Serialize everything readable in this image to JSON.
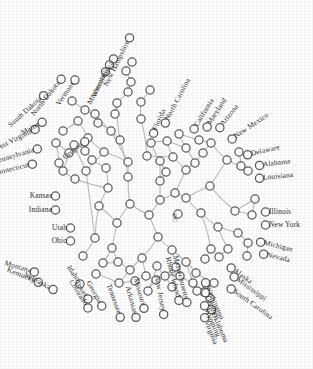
{
  "figure": {
    "type": "radial-dendrogram",
    "center_label": "DC",
    "node_count": 99,
    "leaf_count": 50,
    "colors": {
      "edge": "#b9b9b9",
      "node_stroke": "#5a5a5a",
      "node_fill": "#ffffff",
      "label": "#2b2b2b",
      "background": "#ffffff"
    }
  },
  "chart_data": {
    "type": "tree",
    "layout": "radial-unrooted",
    "center": {
      "x": 160,
      "y": 200
    },
    "grid": false,
    "legend": null,
    "center_node_label": "DC",
    "leaves": [
      {
        "label": "New Hampshire",
        "x": 128,
        "y": 41,
        "angle": -64,
        "anchor": "end"
      },
      {
        "label": "Iowa",
        "x": 112,
        "y": 62,
        "angle": -64,
        "anchor": "end"
      },
      {
        "label": "Wisconsin",
        "x": 108,
        "y": 68,
        "angle": -64,
        "anchor": "end"
      },
      {
        "label": "Minnesota",
        "x": 104,
        "y": 75,
        "angle": -64,
        "anchor": "end"
      },
      {
        "label": "Vermont",
        "x": 73,
        "y": 83,
        "angle": -56,
        "anchor": "end"
      },
      {
        "label": "North Dakota",
        "x": 59,
        "y": 82,
        "angle": -52,
        "anchor": "end"
      },
      {
        "label": "South Dakota",
        "x": 41,
        "y": 98,
        "angle": -42,
        "anchor": "end"
      },
      {
        "label": "Maine",
        "x": 39,
        "y": 124,
        "angle": -29,
        "anchor": "end"
      },
      {
        "label": "West Virginia",
        "x": 32,
        "y": 131,
        "angle": -27,
        "anchor": "end"
      },
      {
        "label": "Oregon",
        "x": 82,
        "y": 144,
        "angle": -38,
        "anchor": "end"
      },
      {
        "label": "Pennsylvania",
        "x": 34,
        "y": 150,
        "angle": -17,
        "anchor": "end"
      },
      {
        "label": "Connecticut",
        "x": 29,
        "y": 165,
        "angle": -14,
        "anchor": "end"
      },
      {
        "label": "Kansas",
        "x": 52,
        "y": 196,
        "angle": 0,
        "anchor": "end"
      },
      {
        "label": "Indiana",
        "x": 52,
        "y": 210,
        "angle": 0,
        "anchor": "end"
      },
      {
        "label": "Utah",
        "x": 67,
        "y": 228,
        "angle": 0,
        "anchor": "end"
      },
      {
        "label": "Ohio",
        "x": 67,
        "y": 241,
        "angle": 0,
        "anchor": "end"
      },
      {
        "label": "Montana",
        "x": 31,
        "y": 271,
        "angle": 16,
        "anchor": "end"
      },
      {
        "label": "Kentucky",
        "x": 35,
        "y": 281,
        "angle": 22,
        "anchor": "end"
      },
      {
        "label": "Nebraska",
        "x": 50,
        "y": 288,
        "angle": 27,
        "anchor": "end"
      },
      {
        "label": "Idaho",
        "x": 78,
        "y": 281,
        "angle": 56,
        "anchor": "end"
      },
      {
        "label": "Texas",
        "x": 86,
        "y": 296,
        "angle": 56,
        "anchor": "end"
      },
      {
        "label": "Colorado",
        "x": 86,
        "y": 305,
        "angle": 57,
        "anchor": "end"
      },
      {
        "label": "Georgia",
        "x": 100,
        "y": 303,
        "angle": 60,
        "anchor": "end"
      },
      {
        "label": "Tennessee",
        "x": 119,
        "y": 314,
        "angle": 70,
        "anchor": "end"
      },
      {
        "label": "Arkansas",
        "x": 135,
        "y": 314,
        "angle": 74,
        "anchor": "end"
      },
      {
        "label": "Missouri",
        "x": 143,
        "y": 305,
        "angle": 74,
        "anchor": "end"
      },
      {
        "label": "New Jersey",
        "x": 163,
        "y": 311,
        "angle": 79,
        "anchor": "end"
      },
      {
        "label": "Rhode Island",
        "x": 178,
        "y": 297,
        "angle": 75,
        "anchor": "end"
      },
      {
        "label": "Massachusetts",
        "x": 186,
        "y": 299,
        "angle": 76,
        "anchor": "end"
      },
      {
        "label": "Washington",
        "x": 207,
        "y": 286,
        "angle": 66,
        "anchor": "start"
      },
      {
        "label": "Oregon",
        "x": 207,
        "y": 296,
        "angle": 66,
        "anchor": "start"
      },
      {
        "label": "Wyoming",
        "x": 206,
        "y": 309,
        "angle": 66,
        "anchor": "start"
      },
      {
        "label": "Oklahoma",
        "x": 213,
        "y": 313,
        "angle": 66,
        "anchor": "start"
      },
      {
        "label": "Virginia",
        "x": 206,
        "y": 321,
        "angle": 68,
        "anchor": "start"
      },
      {
        "label": "Alaska",
        "x": 234,
        "y": 270,
        "angle": 36,
        "anchor": "start"
      },
      {
        "label": "Mississippi",
        "x": 237,
        "y": 279,
        "angle": 36,
        "anchor": "start"
      },
      {
        "label": "South Carolina",
        "x": 234,
        "y": 291,
        "angle": 36,
        "anchor": "start"
      },
      {
        "label": "Michigan",
        "x": 264,
        "y": 243,
        "angle": 14,
        "anchor": "start"
      },
      {
        "label": "Nevada",
        "x": 267,
        "y": 255,
        "angle": 14,
        "anchor": "start"
      },
      {
        "label": "Illinois",
        "x": 269,
        "y": 212,
        "angle": 0,
        "anchor": "start"
      },
      {
        "label": "New York",
        "x": 269,
        "y": 225,
        "angle": 0,
        "anchor": "start"
      },
      {
        "label": "Delaware",
        "x": 251,
        "y": 154,
        "angle": -13,
        "anchor": "start"
      },
      {
        "label": "Alabama",
        "x": 263,
        "y": 165,
        "angle": -7,
        "anchor": "start"
      },
      {
        "label": "Louisiana",
        "x": 263,
        "y": 178,
        "angle": -5,
        "anchor": "start"
      },
      {
        "label": "New Mexico",
        "x": 235,
        "y": 137,
        "angle": -34,
        "anchor": "start"
      },
      {
        "label": "Arizona",
        "x": 222,
        "y": 125,
        "angle": -52,
        "anchor": "start"
      },
      {
        "label": "Maryland",
        "x": 209,
        "y": 124,
        "angle": -57,
        "anchor": "start"
      },
      {
        "label": "California",
        "x": 196,
        "y": 126,
        "angle": -58,
        "anchor": "start"
      },
      {
        "label": "North Carolina",
        "x": 167,
        "y": 120,
        "angle": -62,
        "anchor": "start"
      },
      {
        "label": "Florida",
        "x": 155,
        "y": 130,
        "angle": -66,
        "anchor": "start"
      }
    ],
    "internal_nodes": [
      {
        "x": 160,
        "y": 200
      },
      {
        "x": 149,
        "y": 215
      },
      {
        "x": 160,
        "y": 181
      },
      {
        "x": 130,
        "y": 204
      },
      {
        "x": 175,
        "y": 193
      },
      {
        "x": 158,
        "y": 237
      },
      {
        "x": 117,
        "y": 223
      },
      {
        "x": 186,
        "y": 170
      },
      {
        "x": 142,
        "y": 258
      },
      {
        "x": 99,
        "y": 206
      },
      {
        "x": 178,
        "y": 214
      },
      {
        "x": 128,
        "y": 177
      },
      {
        "x": 186,
        "y": 198
      },
      {
        "x": 186,
        "y": 148
      },
      {
        "x": 172,
        "y": 250
      },
      {
        "x": 112,
        "y": 248
      },
      {
        "x": 201,
        "y": 213
      },
      {
        "x": 128,
        "y": 162
      },
      {
        "x": 210,
        "y": 186
      },
      {
        "x": 108,
        "y": 188
      },
      {
        "x": 195,
        "y": 163
      },
      {
        "x": 146,
        "y": 276
      },
      {
        "x": 103,
        "y": 263
      },
      {
        "x": 218,
        "y": 227
      },
      {
        "x": 186,
        "y": 262
      },
      {
        "x": 95,
        "y": 238
      },
      {
        "x": 235,
        "y": 211
      },
      {
        "x": 135,
        "y": 281
      },
      {
        "x": 83,
        "y": 256
      },
      {
        "x": 196,
        "y": 273
      },
      {
        "x": 203,
        "y": 153
      },
      {
        "x": 120,
        "y": 140
      },
      {
        "x": 211,
        "y": 143
      },
      {
        "x": 167,
        "y": 141
      },
      {
        "x": 151,
        "y": 143
      },
      {
        "x": 238,
        "y": 233
      },
      {
        "x": 227,
        "y": 160
      },
      {
        "x": 160,
        "y": 161
      },
      {
        "x": 141,
        "y": 119
      },
      {
        "x": 75,
        "y": 179
      },
      {
        "x": 86,
        "y": 171
      },
      {
        "x": 104,
        "y": 152
      },
      {
        "x": 88,
        "y": 138
      },
      {
        "x": 74,
        "y": 145
      },
      {
        "x": 63,
        "y": 171
      },
      {
        "x": 59,
        "y": 163
      },
      {
        "x": 111,
        "y": 131
      },
      {
        "x": 98,
        "y": 123
      },
      {
        "x": 95,
        "y": 114
      },
      {
        "x": 117,
        "y": 103
      },
      {
        "x": 128,
        "y": 92
      },
      {
        "x": 131,
        "y": 82
      },
      {
        "x": 126,
        "y": 71
      },
      {
        "x": 132,
        "y": 62
      },
      {
        "x": 85,
        "y": 110
      },
      {
        "x": 72,
        "y": 101
      },
      {
        "x": 78,
        "y": 121
      },
      {
        "x": 63,
        "y": 131
      },
      {
        "x": 56,
        "y": 143
      },
      {
        "x": 248,
        "y": 243
      },
      {
        "x": 247,
        "y": 256
      },
      {
        "x": 228,
        "y": 249
      },
      {
        "x": 219,
        "y": 257
      },
      {
        "x": 211,
        "y": 249
      },
      {
        "x": 205,
        "y": 259
      },
      {
        "x": 193,
        "y": 283
      },
      {
        "x": 180,
        "y": 276
      },
      {
        "x": 214,
        "y": 283
      },
      {
        "x": 204,
        "y": 292
      },
      {
        "x": 210,
        "y": 298
      },
      {
        "x": 197,
        "y": 291
      },
      {
        "x": 172,
        "y": 287
      },
      {
        "x": 165,
        "y": 276
      },
      {
        "x": 157,
        "y": 266
      },
      {
        "x": 130,
        "y": 270
      },
      {
        "x": 118,
        "y": 262
      },
      {
        "x": 96,
        "y": 274
      },
      {
        "x": 119,
        "y": 283
      },
      {
        "x": 156,
        "y": 280
      },
      {
        "x": 148,
        "y": 291
      },
      {
        "x": 176,
        "y": 267
      },
      {
        "x": 255,
        "y": 199
      },
      {
        "x": 252,
        "y": 215
      },
      {
        "x": 241,
        "y": 166
      },
      {
        "x": 239,
        "y": 152
      },
      {
        "x": 248,
        "y": 171
      },
      {
        "x": 199,
        "y": 140
      },
      {
        "x": 179,
        "y": 134
      },
      {
        "x": 173,
        "y": 157
      },
      {
        "x": 166,
        "y": 172
      },
      {
        "x": 147,
        "y": 156
      },
      {
        "x": 106,
        "y": 168
      },
      {
        "x": 92,
        "y": 160
      },
      {
        "x": 115,
        "y": 114
      },
      {
        "x": 141,
        "y": 102
      },
      {
        "x": 150,
        "y": 90
      },
      {
        "x": 69,
        "y": 153
      },
      {
        "x": 85,
        "y": 151
      }
    ],
    "edges": [
      [
        160,
        200,
        149,
        215
      ],
      [
        160,
        200,
        160,
        181
      ],
      [
        160,
        200,
        175,
        193
      ],
      [
        149,
        215,
        130,
        204
      ],
      [
        149,
        215,
        158,
        237
      ],
      [
        130,
        204,
        117,
        223
      ],
      [
        130,
        204,
        128,
        177
      ],
      [
        160,
        181,
        160,
        161
      ],
      [
        160,
        181,
        166,
        172
      ],
      [
        175,
        193,
        186,
        198
      ],
      [
        175,
        193,
        186,
        170
      ],
      [
        158,
        237,
        172,
        250
      ],
      [
        158,
        237,
        142,
        258
      ],
      [
        117,
        223,
        112,
        248
      ],
      [
        117,
        223,
        99,
        206
      ],
      [
        186,
        170,
        195,
        163
      ],
      [
        186,
        170,
        173,
        157
      ],
      [
        186,
        198,
        201,
        213
      ],
      [
        186,
        198,
        210,
        186
      ],
      [
        142,
        258,
        146,
        276
      ],
      [
        142,
        258,
        130,
        270
      ],
      [
        172,
        250,
        186,
        262
      ],
      [
        172,
        250,
        176,
        267
      ],
      [
        99,
        206,
        95,
        238
      ],
      [
        99,
        206,
        108,
        188
      ],
      [
        128,
        177,
        128,
        162
      ],
      [
        128,
        177,
        120,
        140
      ],
      [
        112,
        248,
        103,
        263
      ],
      [
        112,
        248,
        118,
        262
      ],
      [
        201,
        213,
        218,
        227
      ],
      [
        201,
        213,
        211,
        249
      ],
      [
        210,
        186,
        227,
        160
      ],
      [
        210,
        186,
        235,
        211
      ],
      [
        95,
        238,
        83,
        256
      ],
      [
        95,
        238,
        86,
        171
      ],
      [
        108,
        188,
        106,
        168
      ],
      [
        108,
        188,
        75,
        179
      ],
      [
        128,
        162,
        111,
        131
      ],
      [
        128,
        162,
        104,
        152
      ],
      [
        120,
        140,
        117,
        103
      ],
      [
        120,
        140,
        111,
        131
      ],
      [
        146,
        276,
        135,
        281
      ],
      [
        146,
        276,
        156,
        280
      ],
      [
        130,
        270,
        119,
        283
      ],
      [
        130,
        270,
        118,
        262
      ],
      [
        186,
        262,
        196,
        273
      ],
      [
        186,
        262,
        193,
        283
      ],
      [
        176,
        267,
        165,
        276
      ],
      [
        176,
        267,
        172,
        287
      ],
      [
        218,
        227,
        238,
        233
      ],
      [
        218,
        227,
        228,
        249
      ],
      [
        235,
        211,
        252,
        215
      ],
      [
        235,
        211,
        255,
        199
      ],
      [
        227,
        160,
        241,
        166
      ],
      [
        227,
        160,
        211,
        143
      ],
      [
        211,
        143,
        199,
        140
      ],
      [
        211,
        143,
        203,
        153
      ],
      [
        173,
        157,
        167,
        141
      ],
      [
        173,
        157,
        147,
        156
      ],
      [
        166,
        172,
        160,
        161
      ],
      [
        166,
        172,
        151,
        143
      ],
      [
        195,
        163,
        203,
        153
      ],
      [
        195,
        163,
        186,
        148
      ],
      [
        186,
        148,
        179,
        134
      ],
      [
        186,
        148,
        167,
        141
      ],
      [
        167,
        141,
        151,
        143
      ],
      [
        104,
        152,
        88,
        138
      ],
      [
        104,
        152,
        86,
        171
      ],
      [
        111,
        131,
        98,
        123
      ],
      [
        111,
        131,
        95,
        114
      ],
      [
        117,
        103,
        128,
        92
      ],
      [
        117,
        103,
        115,
        114
      ],
      [
        128,
        92,
        131,
        82
      ],
      [
        131,
        82,
        126,
        71
      ],
      [
        126,
        71,
        132,
        62
      ],
      [
        95,
        114,
        85,
        110
      ],
      [
        85,
        110,
        72,
        101
      ],
      [
        88,
        138,
        78,
        121
      ],
      [
        78,
        121,
        63,
        131
      ],
      [
        86,
        171,
        74,
        145
      ],
      [
        74,
        145,
        63,
        171
      ],
      [
        75,
        179,
        63,
        171
      ],
      [
        63,
        171,
        59,
        163
      ],
      [
        59,
        163,
        56,
        143
      ],
      [
        56,
        143,
        69,
        153
      ],
      [
        106,
        168,
        92,
        160
      ],
      [
        92,
        160,
        85,
        151
      ],
      [
        238,
        233,
        248,
        243
      ],
      [
        248,
        243,
        247,
        256
      ],
      [
        228,
        249,
        219,
        257
      ],
      [
        219,
        257,
        211,
        249
      ],
      [
        211,
        249,
        205,
        259
      ],
      [
        196,
        273,
        214,
        283
      ],
      [
        214,
        283,
        204,
        292
      ],
      [
        204,
        292,
        210,
        298
      ],
      [
        204,
        292,
        197,
        291
      ],
      [
        193,
        283,
        180,
        276
      ],
      [
        172,
        287,
        165,
        276
      ],
      [
        157,
        266,
        165,
        276
      ],
      [
        157,
        266,
        148,
        291
      ],
      [
        135,
        281,
        119,
        283
      ],
      [
        119,
        283,
        96,
        274
      ],
      [
        118,
        262,
        103,
        263
      ],
      [
        252,
        215,
        255,
        199
      ],
      [
        241,
        166,
        239,
        152
      ],
      [
        241,
        166,
        248,
        171
      ],
      [
        199,
        140,
        179,
        134
      ],
      [
        147,
        156,
        141,
        119
      ],
      [
        141,
        119,
        141,
        102
      ],
      [
        141,
        102,
        150,
        90
      ],
      [
        156,
        280,
        148,
        291
      ]
    ]
  }
}
